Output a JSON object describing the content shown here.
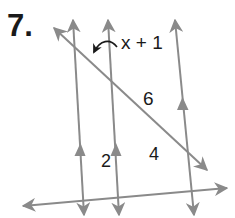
{
  "problem": {
    "number_label": "7.",
    "angle_expression": "x + 1",
    "segment_labels": {
      "diagonal_segment": "6",
      "bottom_left_segment": "2",
      "bottom_right_segment": "4"
    }
  },
  "diagram": {
    "line_color": "#8a8a8a",
    "text_color": "#1a1a1a",
    "parallel_lines": [
      {
        "id": "parallel-line-1",
        "x1": 73,
        "y1": 20,
        "x2": 84,
        "y2": 215,
        "marker": {
          "x": 80,
          "y": 148
        }
      },
      {
        "id": "parallel-line-2",
        "x1": 108,
        "y1": 20,
        "x2": 119,
        "y2": 215,
        "marker": {
          "x": 116,
          "y": 148
        }
      },
      {
        "id": "parallel-line-3",
        "x1": 175,
        "y1": 20,
        "x2": 194,
        "y2": 215,
        "marker": {
          "x": 183,
          "y": 102
        }
      }
    ],
    "transversals": [
      {
        "id": "diagonal-transversal",
        "x1": 54,
        "y1": 28,
        "x2": 207,
        "y2": 170
      },
      {
        "id": "bottom-transversal",
        "x1": 23,
        "y1": 206,
        "x2": 227,
        "y2": 188
      }
    ]
  }
}
